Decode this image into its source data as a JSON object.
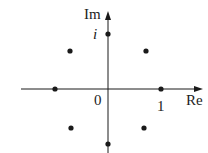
{
  "diagram": {
    "axes": {
      "x_label": "Re",
      "y_label": "Im",
      "origin_label": "0",
      "one_label": "1",
      "i_label": "i"
    },
    "points": [
      {
        "name": "1",
        "x": 161,
        "y": 89
      },
      {
        "name": "e^(iπ/4)",
        "x": 146,
        "y": 51
      },
      {
        "name": "i",
        "x": 108,
        "y": 34
      },
      {
        "name": "e^(i3π/4)",
        "x": 70,
        "y": 51
      },
      {
        "name": "-1",
        "x": 55,
        "y": 89
      },
      {
        "name": "e^(i5π/4)",
        "x": 71,
        "y": 128
      },
      {
        "name": "-i",
        "x": 108,
        "y": 144
      },
      {
        "name": "e^(i7π/4)",
        "x": 144,
        "y": 128
      }
    ],
    "colors": {
      "ink": "#1a1a1a",
      "background": "#ffffff"
    }
  }
}
